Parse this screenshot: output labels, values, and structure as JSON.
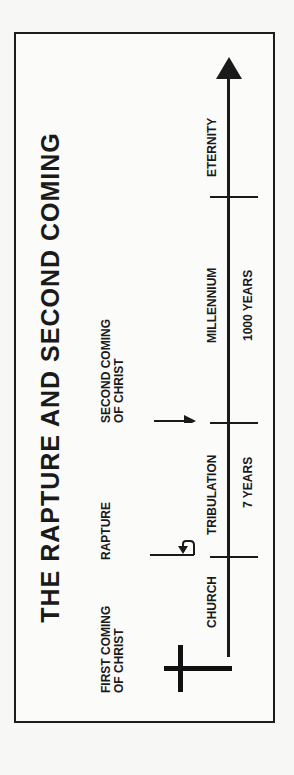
{
  "diagram": {
    "title": "THE RAPTURE AND SECOND COMING",
    "orientation": "rotated 90 degrees counter-clockwise",
    "events": {
      "first_coming": [
        "FIRST COMING",
        "OF CHRIST"
      ],
      "rapture": "RAPTURE",
      "second_coming": [
        "SECOND COMING",
        "OF CHRIST"
      ]
    },
    "periods": [
      {
        "name": "CHURCH",
        "duration": ""
      },
      {
        "name": "TRIBULATION",
        "duration": "7 YEARS"
      },
      {
        "name": "MILLENNIUM",
        "duration": "1000 YEARS"
      },
      {
        "name": "ETERNITY",
        "duration": ""
      }
    ],
    "icons": {
      "start": "cross-icon",
      "rapture": "upturn-arrow-icon",
      "second_coming": "down-arrow-icon",
      "end": "arrowhead-icon"
    },
    "colors": {
      "ink": "#1a1a1a",
      "paper": "#fbfbfa"
    }
  }
}
